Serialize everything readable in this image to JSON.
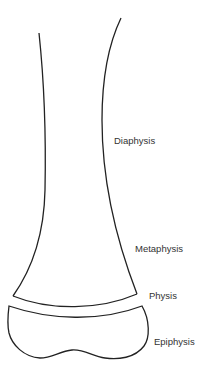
{
  "diagram": {
    "labels": [
      {
        "id": "diaphysis",
        "text": "Diaphysis"
      },
      {
        "id": "metaphysis",
        "text": "Metaphysis"
      },
      {
        "id": "physis",
        "text": "Physis"
      },
      {
        "id": "epiphysis",
        "text": "Epiphysis"
      }
    ],
    "colors": {
      "stroke": "#222222",
      "text": "#333333",
      "background": "#ffffff"
    }
  }
}
